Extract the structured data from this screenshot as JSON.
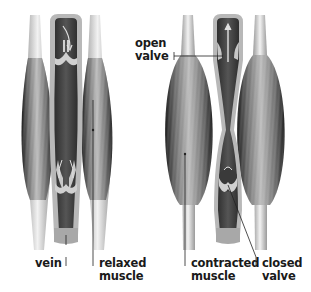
{
  "figure": {
    "panels": [
      {
        "id": "relaxed",
        "state": "relaxed muscle, valves shown",
        "flow_arrow": "curved arrow down into valve cusps"
      },
      {
        "id": "contracted",
        "state": "contracted muscle squeezes vein, blood pushed upward",
        "flow_arrow": "straight arrow up through open valve"
      }
    ]
  },
  "labels": {
    "vein": "vein",
    "relaxed_muscle": "relaxed\nmuscle",
    "open_valve": "open\nvalve",
    "contracted_muscle": "contracted\nmuscle",
    "closed_valve": "closed\nvalve"
  },
  "colors": {
    "background": "#ffffff",
    "vein_wall": "#b8b8b8",
    "vein_lumen": "#4a4a4a",
    "muscle_dark": "#2e2e2e",
    "muscle_light": "#bdbdbd",
    "tendon": "#e6e6e6",
    "label_text": "#1a1a1a"
  }
}
